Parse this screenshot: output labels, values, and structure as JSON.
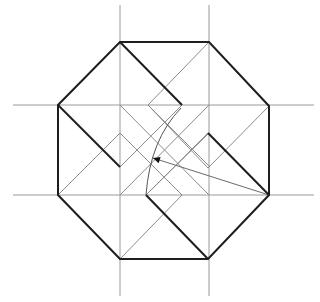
{
  "diagram": {
    "type": "geometric-construction",
    "colors": {
      "background": "#ffffff",
      "bold_stroke": "#1e1e1e",
      "guide_stroke": "#9a9a9a",
      "construction_stroke": "#8c8c8c"
    },
    "guides": [
      {
        "x1": 120,
        "y1": 5,
        "x2": 120,
        "y2": 296
      },
      {
        "x1": 209,
        "y1": 5,
        "x2": 209,
        "y2": 296
      },
      {
        "x1": 13,
        "y1": 105,
        "x2": 314,
        "y2": 105
      },
      {
        "x1": 13,
        "y1": 195,
        "x2": 314,
        "y2": 195
      }
    ],
    "octagon": [
      [
        120,
        42
      ],
      [
        209,
        42
      ],
      [
        269,
        106
      ],
      [
        269,
        195
      ],
      [
        208,
        259
      ],
      [
        120,
        259
      ],
      [
        58,
        195
      ],
      [
        58,
        105
      ]
    ],
    "bold_arms": [
      [
        [
          120,
          42
        ],
        [
          182,
          105
        ]
      ],
      [
        [
          269,
          195
        ],
        [
          208,
          133
        ]
      ],
      [
        [
          208,
          259
        ],
        [
          146,
          195
        ]
      ],
      [
        [
          58,
          105
        ],
        [
          120,
          167
        ]
      ]
    ],
    "construction_lines": [
      [
        [
          209,
          42
        ],
        [
          148,
          105
        ],
        [
          209,
          166
        ]
      ],
      [
        [
          182,
          105
        ],
        [
          120,
          167
        ]
      ],
      [
        [
          269,
          106
        ],
        [
          208,
          168
        ],
        [
          148,
          105
        ]
      ],
      [
        [
          208,
          133
        ],
        [
          146,
          195
        ]
      ],
      [
        [
          120,
          259
        ],
        [
          182,
          195
        ],
        [
          120,
          133
        ]
      ],
      [
        [
          146,
          195
        ],
        [
          209,
          133
        ]
      ],
      [
        [
          58,
          195
        ],
        [
          120,
          133
        ],
        [
          182,
          195
        ]
      ],
      [
        [
          120,
          167
        ],
        [
          182,
          105
        ]
      ],
      [
        [
          120,
          105
        ],
        [
          209,
          195
        ]
      ],
      [
        [
          209,
          105
        ],
        [
          120,
          195
        ]
      ]
    ],
    "arc": {
      "d": "M 181 108 Q 150 140 146 195"
    },
    "arrow": {
      "from": [
        269,
        195
      ],
      "to": [
        153,
        158
      ]
    }
  }
}
